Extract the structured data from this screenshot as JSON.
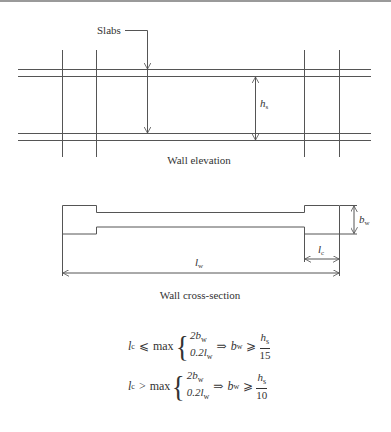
{
  "figure": {
    "elevation": {
      "slabs_label": "Slabs",
      "hs_symbol": "h",
      "hs_subscript": "s",
      "caption": "Wall elevation"
    },
    "cross_section": {
      "lw_symbol": "l",
      "lw_subscript": "w",
      "lc_symbol": "l",
      "lc_subscript": "c",
      "bw_symbol": "b",
      "bw_subscript": "w",
      "caption": "Wall cross-section"
    },
    "formulas": [
      {
        "lhs": "l",
        "lhs_sub": "c",
        "relation": "⩽",
        "max_label": "max",
        "case1": "2b",
        "case1_sub": "w",
        "case2": "0.2l",
        "case2_sub": "w",
        "implies": "⇒",
        "result_var": "b",
        "result_sub": "w",
        "result_rel": "⩾",
        "numerator": "h",
        "numerator_sub": "s",
        "denominator": "15"
      },
      {
        "lhs": "l",
        "lhs_sub": "c",
        "relation": ">",
        "max_label": "max",
        "case1": "2b",
        "case1_sub": "w",
        "case2": "0.2l",
        "case2_sub": "w",
        "implies": "⇒",
        "result_var": "b",
        "result_sub": "w",
        "result_rel": "⩾",
        "numerator": "h",
        "numerator_sub": "s",
        "denominator": "10"
      }
    ],
    "colors": {
      "line": "#555555",
      "text": "#333333",
      "top_border": "#9a9a9a"
    }
  }
}
